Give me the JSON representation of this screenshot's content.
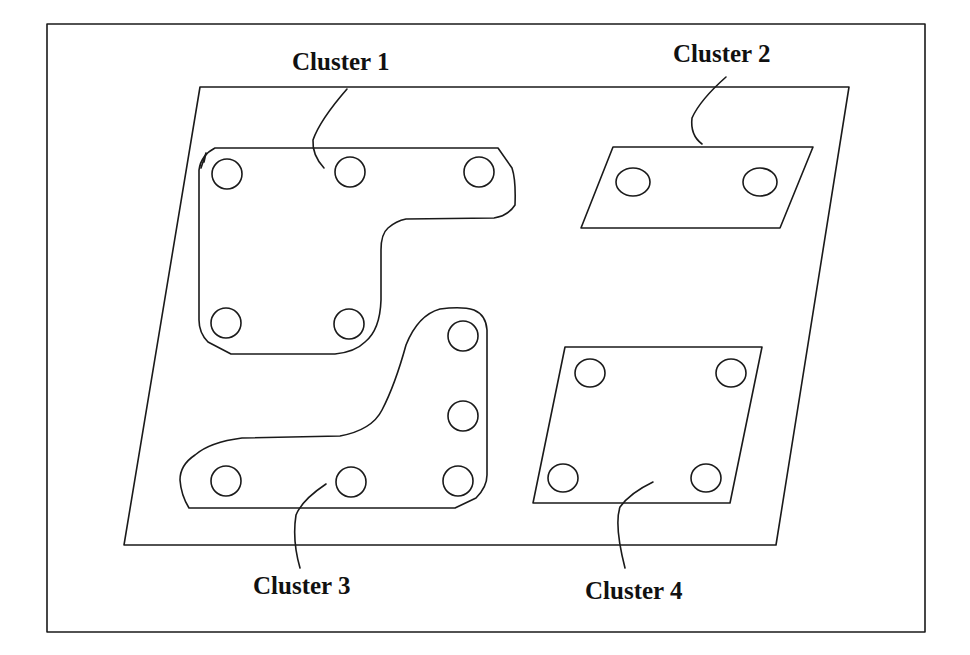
{
  "diagram": {
    "type": "board-layout-clusters",
    "clusters": [
      {
        "id": 1,
        "label": "Cluster 1",
        "hole_count": 5
      },
      {
        "id": 2,
        "label": "Cluster 2",
        "hole_count": 2
      },
      {
        "id": 3,
        "label": "Cluster 3",
        "hole_count": 6
      },
      {
        "id": 4,
        "label": "Cluster 4",
        "hole_count": 4
      }
    ]
  },
  "colors": {
    "stroke": "#1a1a1a",
    "background": "#ffffff"
  }
}
